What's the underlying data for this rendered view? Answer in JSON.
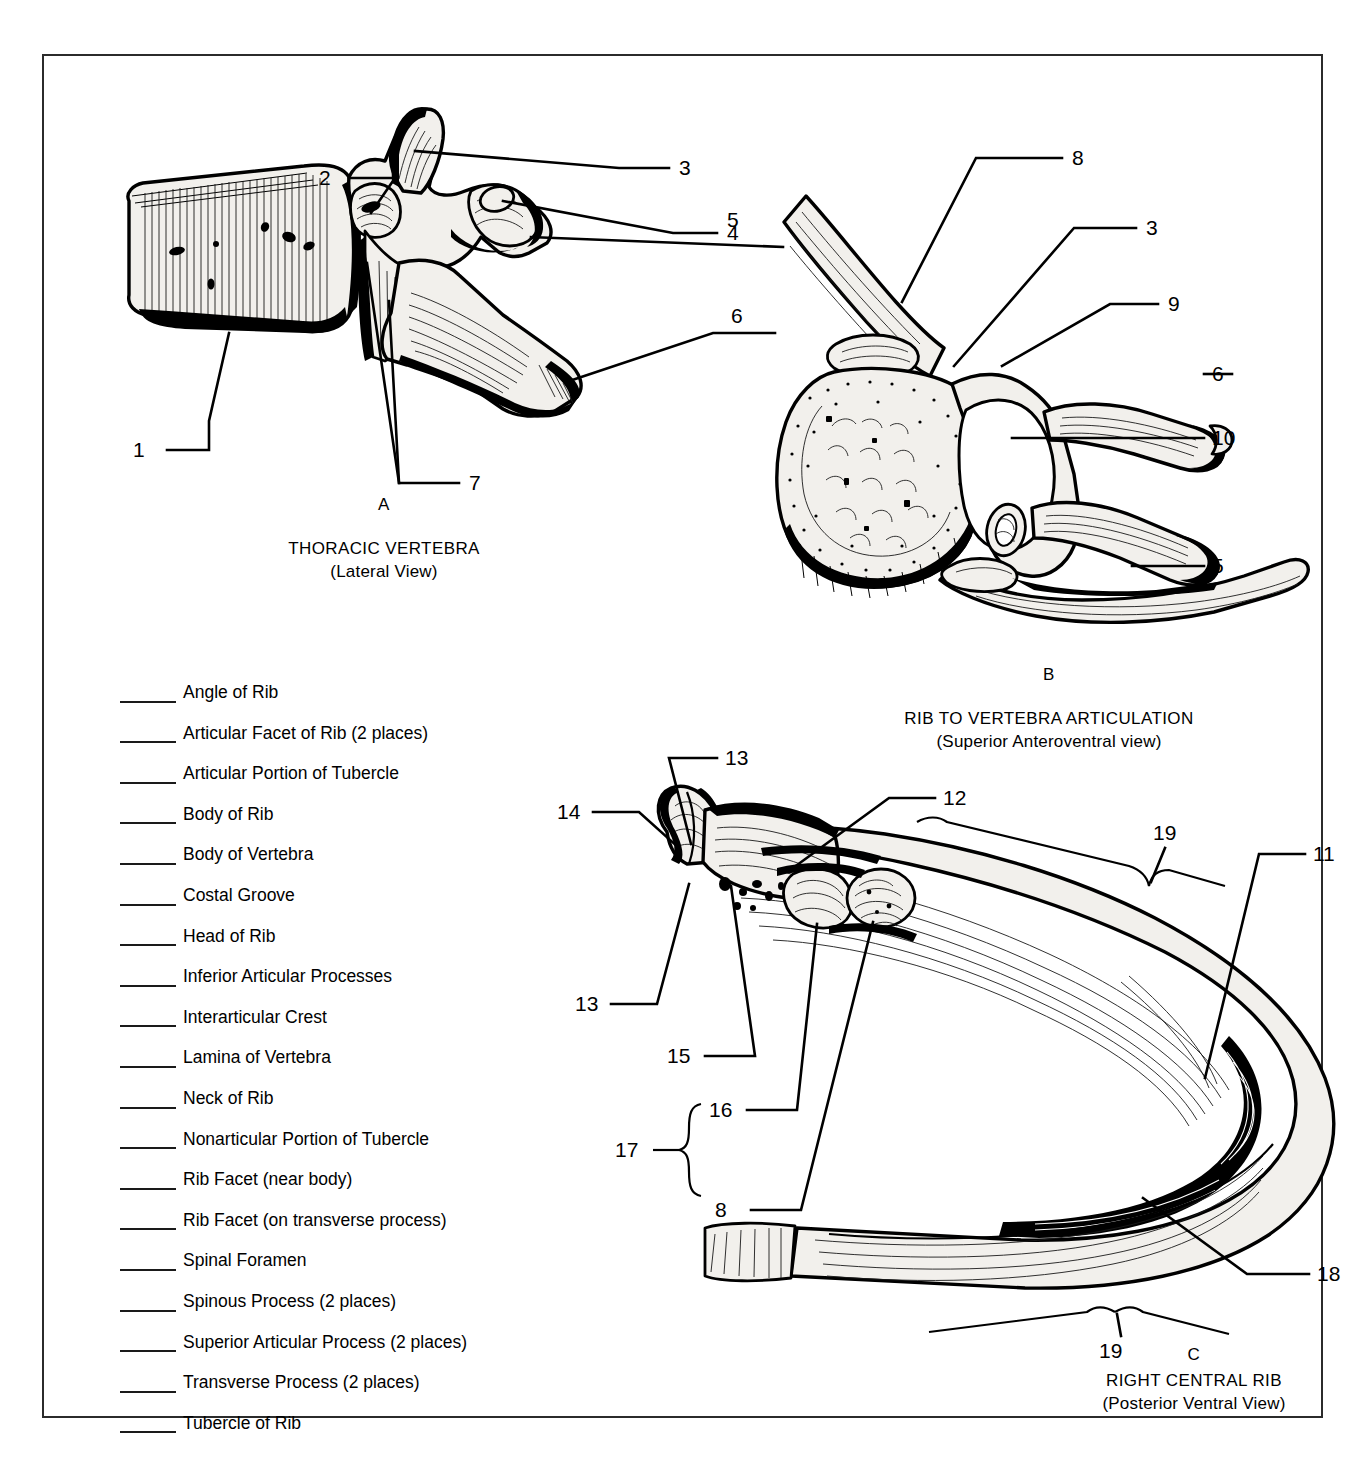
{
  "worksheet": {
    "figures": [
      {
        "letter": "A",
        "title": "THORACIC VERTEBRA",
        "subtitle": "(Lateral View)",
        "callouts": [
          "1",
          "2",
          "3",
          "4",
          "5",
          "6",
          "7"
        ]
      },
      {
        "letter": "B",
        "title": "RIB TO VERTEBRA ARTICULATION",
        "subtitle": "(Superior Anteroventral view)",
        "callouts": [
          "8",
          "3",
          "9",
          "6",
          "10",
          "5"
        ]
      },
      {
        "letter": "C",
        "title": "RIGHT CENTRAL RIB",
        "subtitle": "(Posterior Ventral View)",
        "callouts": [
          "13",
          "12",
          "14",
          "19",
          "11",
          "13",
          "15",
          "16",
          "17",
          "8",
          "19",
          "18"
        ]
      }
    ],
    "answer_list": [
      "Angle of Rib",
      "Articular Facet of Rib (2 places)",
      "Articular Portion of Tubercle",
      "Body of Rib",
      "Body of Vertebra",
      "Costal Groove",
      "Head of Rib",
      "Inferior Articular Processes",
      "Interarticular Crest",
      "Lamina of Vertebra",
      "Neck of Rib",
      "Nonarticular Portion of Tubercle",
      "Rib Facet (near body)",
      "Rib Facet (on transverse process)",
      "Spinal Foramen",
      "Spinous Process (2 places)",
      "Superior Articular Process (2 places)",
      "Transverse Process (2 places)",
      "Tubercle of Rib"
    ],
    "figure_a_numbers": {
      "n1": "1",
      "n2": "2",
      "n3": "3",
      "n4": "4",
      "n5": "5",
      "n6": "6",
      "n7": "7"
    },
    "figure_b_numbers": {
      "n8": "8",
      "n3": "3",
      "n9": "9",
      "n6": "6",
      "n10": "10",
      "n5": "5"
    },
    "figure_c_numbers": {
      "n13a": "13",
      "n12": "12",
      "n14": "14",
      "n19a": "19",
      "n11": "11",
      "n13b": "13",
      "n15": "15",
      "n16": "16",
      "n17": "17",
      "n8": "8",
      "n19b": "19",
      "n18": "18"
    },
    "colors": {
      "ink": "#000000",
      "frame": "#2b2b2b",
      "bone_fill": "#f2f0ec",
      "page": "#ffffff"
    }
  }
}
